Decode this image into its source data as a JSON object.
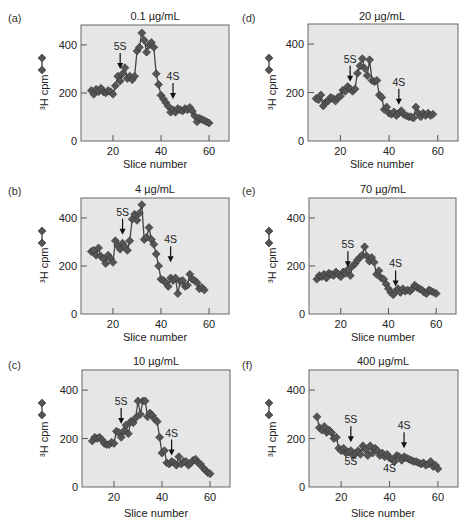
{
  "figure": {
    "x_axis_label": "Slice number",
    "y_axis_label": "³H cpm",
    "plot_background": "#e6e6e6",
    "marker_color": "#555555",
    "line_color": "#444444"
  },
  "chart_data": [
    {
      "type": "line",
      "panel": "(a)",
      "title": "0.1 µg/mL",
      "xlabel": "Slice number",
      "ylabel": "³H cpm",
      "xticks": [
        20,
        40,
        60
      ],
      "yticks": [
        0,
        200,
        400
      ],
      "xlim": [
        6.7,
        68.3
      ],
      "ylim": [
        0,
        483
      ],
      "grid": false,
      "annotations": [
        {
          "label": "5S",
          "x": 23,
          "y_arrow_tip": 300
        },
        {
          "label": "4S",
          "x": 45,
          "y_arrow_tip": 175
        }
      ],
      "x": [
        11,
        12,
        13,
        14,
        15,
        16,
        17,
        18,
        19,
        20,
        21,
        22,
        23,
        24,
        25,
        26,
        27,
        28,
        29,
        30,
        31,
        32,
        33,
        34,
        35,
        36,
        37,
        38,
        39,
        40,
        41,
        42,
        43,
        44,
        45,
        46,
        47,
        48,
        49,
        50,
        51,
        52,
        53,
        54,
        55,
        56,
        57,
        58,
        59,
        60
      ],
      "values": [
        210,
        195,
        215,
        205,
        220,
        205,
        200,
        210,
        205,
        195,
        230,
        270,
        250,
        280,
        305,
        260,
        270,
        255,
        270,
        375,
        390,
        450,
        420,
        370,
        400,
        410,
        390,
        280,
        235,
        190,
        175,
        160,
        145,
        120,
        130,
        120,
        135,
        130,
        125,
        135,
        130,
        140,
        125,
        105,
        80,
        95,
        90,
        85,
        80,
        75
      ]
    },
    {
      "type": "line",
      "panel": "(b)",
      "title": "4 µg/mL",
      "xlabel": "Slice number",
      "ylabel": "³H cpm",
      "xticks": [
        20,
        40,
        60
      ],
      "yticks": [
        0,
        200,
        400
      ],
      "xlim": [
        6.7,
        68.3
      ],
      "ylim": [
        0,
        483
      ],
      "grid": false,
      "annotations": [
        {
          "label": "5S",
          "x": 24,
          "y_arrow_tip": 330
        },
        {
          "label": "4S",
          "x": 44,
          "y_arrow_tip": 215
        }
      ],
      "x": [
        11,
        12,
        13,
        14,
        15,
        16,
        17,
        18,
        19,
        20,
        21,
        22,
        23,
        24,
        25,
        26,
        27,
        28,
        29,
        30,
        31,
        32,
        33,
        34,
        35,
        36,
        37,
        38,
        39,
        40,
        41,
        42,
        43,
        44,
        45,
        46,
        47,
        48,
        49,
        50,
        51,
        52,
        53,
        54,
        55,
        56,
        57,
        58
      ],
      "values": [
        260,
        265,
        245,
        275,
        240,
        230,
        210,
        245,
        230,
        215,
        305,
        285,
        270,
        295,
        280,
        265,
        305,
        395,
        415,
        390,
        420,
        455,
        310,
        320,
        360,
        310,
        290,
        250,
        200,
        145,
        140,
        130,
        115,
        150,
        140,
        150,
        85,
        135,
        140,
        115,
        120,
        165,
        145,
        140,
        130,
        105,
        110,
        100
      ]
    },
    {
      "type": "line",
      "panel": "(c)",
      "title": "10 µg/mL",
      "xlabel": "Slice number",
      "ylabel": "³H cpm",
      "xticks": [
        20,
        40,
        60
      ],
      "yticks": [
        0,
        200,
        400
      ],
      "xlim": [
        6.7,
        68.3
      ],
      "ylim": [
        0,
        483
      ],
      "grid": false,
      "annotations": [
        {
          "label": "5S",
          "x": 23,
          "y_arrow_tip": 260
        },
        {
          "label": "4S",
          "x": 44,
          "y_arrow_tip": 130
        }
      ],
      "x": [
        11,
        12,
        13,
        14,
        15,
        16,
        17,
        18,
        19,
        20,
        21,
        22,
        23,
        24,
        25,
        26,
        27,
        28,
        29,
        30,
        31,
        32,
        33,
        34,
        35,
        36,
        37,
        38,
        39,
        40,
        41,
        42,
        43,
        44,
        45,
        46,
        47,
        48,
        49,
        50,
        51,
        52,
        53,
        54,
        55,
        56,
        57,
        58,
        59,
        60
      ],
      "values": [
        190,
        205,
        200,
        205,
        195,
        180,
        175,
        175,
        185,
        180,
        230,
        225,
        205,
        230,
        255,
        220,
        270,
        265,
        285,
        355,
        300,
        355,
        355,
        290,
        305,
        295,
        280,
        270,
        205,
        140,
        150,
        100,
        95,
        105,
        100,
        90,
        125,
        95,
        105,
        105,
        90,
        100,
        110,
        115,
        100,
        95,
        80,
        70,
        60,
        55
      ]
    },
    {
      "type": "line",
      "panel": "(d)",
      "title": "20 µg/mL",
      "xlabel": "Slice number",
      "ylabel": "³H cpm",
      "xticks": [
        20,
        40,
        60
      ],
      "yticks": [
        0,
        200,
        400
      ],
      "xlim": [
        6.7,
        68.3
      ],
      "ylim": [
        0,
        483
      ],
      "grid": false,
      "annotations": [
        {
          "label": "5S",
          "x": 24,
          "y_arrow_tip": 245
        },
        {
          "label": "4S",
          "x": 44,
          "y_arrow_tip": 150
        }
      ],
      "x": [
        10,
        11,
        12,
        13,
        14,
        15,
        16,
        17,
        18,
        19,
        20,
        21,
        22,
        23,
        24,
        25,
        26,
        27,
        28,
        29,
        30,
        31,
        32,
        33,
        34,
        35,
        36,
        37,
        38,
        39,
        40,
        41,
        42,
        43,
        44,
        45,
        46,
        47,
        48,
        49,
        50,
        51,
        52,
        53,
        54,
        55,
        56,
        57,
        58
      ],
      "values": [
        175,
        170,
        190,
        145,
        160,
        165,
        180,
        175,
        165,
        180,
        185,
        210,
        205,
        225,
        215,
        205,
        215,
        280,
        310,
        340,
        300,
        270,
        335,
        250,
        245,
        250,
        190,
        180,
        130,
        140,
        115,
        110,
        120,
        105,
        115,
        125,
        110,
        105,
        100,
        100,
        95,
        140,
        115,
        100,
        115,
        105,
        115,
        105,
        110
      ]
    },
    {
      "type": "line",
      "panel": "(e)",
      "title": "70 µg/mL",
      "xlabel": "Slice number",
      "ylabel": "³H cpm",
      "xticks": [
        20,
        40,
        60
      ],
      "yticks": [
        0,
        200,
        400
      ],
      "xlim": [
        6.7,
        68.3
      ],
      "ylim": [
        0,
        483
      ],
      "grid": false,
      "annotations": [
        {
          "label": "5S",
          "x": 23,
          "y_arrow_tip": 195
        },
        {
          "label": "4S",
          "x": 43,
          "y_arrow_tip": 115
        }
      ],
      "x": [
        10,
        11,
        12,
        13,
        14,
        15,
        16,
        17,
        18,
        19,
        20,
        21,
        22,
        23,
        24,
        25,
        26,
        27,
        28,
        29,
        30,
        31,
        32,
        33,
        34,
        35,
        36,
        37,
        38,
        39,
        40,
        41,
        42,
        43,
        44,
        45,
        46,
        47,
        48,
        49,
        50,
        51,
        52,
        53,
        54,
        55,
        56,
        57,
        58,
        59,
        60
      ],
      "values": [
        145,
        160,
        155,
        165,
        150,
        170,
        165,
        160,
        175,
        165,
        155,
        175,
        170,
        185,
        160,
        200,
        210,
        225,
        235,
        245,
        280,
        240,
        220,
        235,
        215,
        165,
        180,
        150,
        145,
        125,
        105,
        90,
        80,
        95,
        105,
        90,
        105,
        95,
        100,
        95,
        105,
        120,
        110,
        105,
        100,
        90,
        85,
        100,
        95,
        90,
        85
      ]
    },
    {
      "type": "line",
      "panel": "(f)",
      "title": "400 µg/mL",
      "xlabel": "Slice number",
      "ylabel": "³H cpm",
      "xticks": [
        20,
        40,
        60
      ],
      "yticks": [
        0,
        200,
        400
      ],
      "xlim": [
        6.7,
        68.3
      ],
      "ylim": [
        0,
        483
      ],
      "grid": false,
      "annotations": [
        {
          "label": "5S",
          "x": 24,
          "y_arrow_tip": 185
        },
        {
          "label": "4S",
          "x": 46,
          "y_arrow_tip": 160
        },
        {
          "label": "5S",
          "x": 24,
          "y_text": 90,
          "below": true
        },
        {
          "label": "4S",
          "x": 40,
          "y_text": 60,
          "below": true
        }
      ],
      "x": [
        10,
        11,
        12,
        13,
        14,
        15,
        16,
        17,
        18,
        19,
        20,
        21,
        22,
        23,
        24,
        25,
        26,
        27,
        28,
        29,
        30,
        31,
        32,
        33,
        34,
        35,
        36,
        37,
        38,
        39,
        40,
        41,
        42,
        43,
        44,
        45,
        46,
        47,
        48,
        49,
        50,
        51,
        52,
        53,
        54,
        55,
        56,
        57,
        58,
        59,
        60
      ],
      "values": [
        290,
        245,
        235,
        250,
        225,
        235,
        225,
        200,
        205,
        160,
        150,
        160,
        140,
        145,
        150,
        130,
        140,
        150,
        135,
        170,
        155,
        130,
        170,
        140,
        160,
        150,
        130,
        140,
        125,
        135,
        120,
        115,
        105,
        130,
        125,
        110,
        125,
        120,
        115,
        110,
        105,
        105,
        100,
        95,
        100,
        90,
        95,
        105,
        85,
        90,
        75
      ]
    }
  ]
}
